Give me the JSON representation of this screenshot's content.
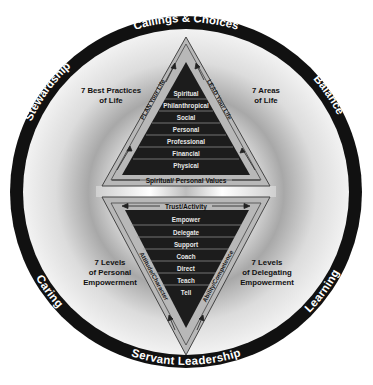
{
  "diagram": {
    "outer_ring_labels": {
      "top": "Callings & Choices",
      "top_right": "Balance",
      "top_left": "Stewardship",
      "bottom_left": "Caring",
      "bottom_right": "Learning",
      "bottom": "Servant Leadership"
    },
    "side_labels": {
      "upper_left": [
        "7 Best Practices",
        "of Life"
      ],
      "upper_right": [
        "7 Areas",
        "of Life"
      ],
      "lower_left": [
        "7 Levels",
        "of Personal",
        "Empowerment"
      ],
      "lower_right": [
        "7 Levels",
        "of Delegating",
        "Empowerment"
      ]
    },
    "upper_pyramid": {
      "left_edge_label": "PLAN Your Life",
      "right_edge_label": "LEAD Your Life",
      "base_label": "Spiritual/ Personal Values",
      "levels": [
        "Spiritual",
        "Philanthropical",
        "Social",
        "Personal",
        "Professional",
        "Financial",
        "Physical"
      ]
    },
    "lower_pyramid": {
      "top_label": "Trust/Activity",
      "left_edge_label": "Attitude/Character",
      "right_edge_label": "Ability/Competence",
      "levels": [
        "Empower",
        "Delegate",
        "Support",
        "Coach",
        "Direct",
        "Teach",
        "Tell"
      ]
    },
    "colors": {
      "ring": "#111111",
      "pyramid_fill": "#1c1c1c",
      "frame_fill": "#b8b8b8",
      "background": "#ffffff"
    }
  }
}
